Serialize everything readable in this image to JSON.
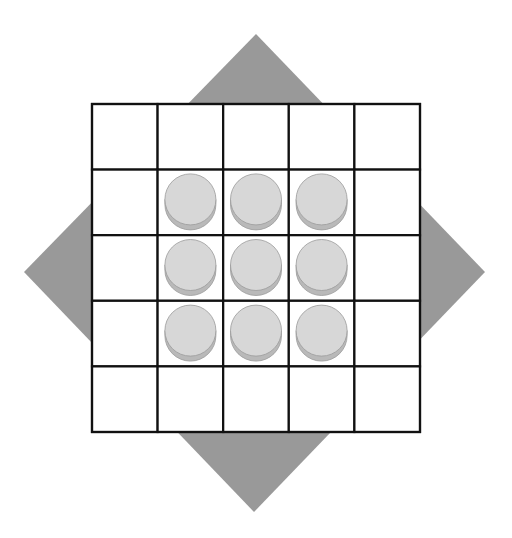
{
  "colors": {
    "background": "#ffffff",
    "diamond": "#999999",
    "grid_line": "#111111",
    "cell_fill": "#ffffff",
    "disc_face": "#d7d7d7",
    "disc_rim": "#b9b9b9",
    "disc_outline": "#9a9a9a"
  },
  "diamond": {
    "shape": "rotated-square",
    "points": [
      [
        256,
        34
      ],
      [
        485,
        272
      ],
      [
        254,
        512
      ],
      [
        24,
        272
      ]
    ]
  },
  "board": {
    "rows": 5,
    "cols": 5,
    "left": 92,
    "top": 104,
    "cell_size": 65.6,
    "line_width": 2.2
  },
  "pieces": [
    {
      "row": 1,
      "col": 1,
      "type": "disc"
    },
    {
      "row": 1,
      "col": 2,
      "type": "disc"
    },
    {
      "row": 1,
      "col": 3,
      "type": "disc"
    },
    {
      "row": 2,
      "col": 1,
      "type": "disc"
    },
    {
      "row": 2,
      "col": 2,
      "type": "disc"
    },
    {
      "row": 2,
      "col": 3,
      "type": "disc"
    },
    {
      "row": 3,
      "col": 1,
      "type": "disc"
    },
    {
      "row": 3,
      "col": 2,
      "type": "disc"
    },
    {
      "row": 3,
      "col": 3,
      "type": "disc"
    }
  ]
}
